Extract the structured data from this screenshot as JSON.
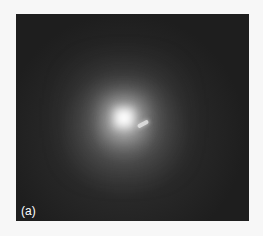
{
  "figure": {
    "panel_label": "(a)",
    "colors": {
      "page_background": "#f7f7f7",
      "frame_background": "#1e1e1e",
      "core": "#ffffff"
    }
  }
}
